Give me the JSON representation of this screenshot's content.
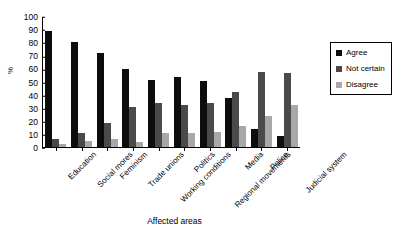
{
  "chart_data": {
    "type": "bar",
    "title": "",
    "subtitle": "",
    "xlabel": "Affected areas",
    "ylabel": "%",
    "ylim": [
      0,
      100
    ],
    "yticks": [
      0,
      10,
      20,
      30,
      40,
      50,
      60,
      70,
      80,
      90,
      100
    ],
    "grid": false,
    "legend_position": "right",
    "categories": [
      "Education",
      "Social mores",
      "Feminism",
      "Trade unions",
      "Working conditions",
      "Politics",
      "Regional movements",
      "Media",
      "Police",
      "Judicial system"
    ],
    "series": [
      {
        "name": "Agree",
        "color": "#0d0d0d",
        "values": [
          89,
          80.5,
          72.5,
          60,
          51.5,
          54,
          50.5,
          37.5,
          14,
          8.5
        ]
      },
      {
        "name": "Not certain",
        "color": "#4a4a4a",
        "values": [
          6,
          11,
          18.5,
          30.5,
          33.5,
          32.5,
          34,
          42,
          58,
          57
        ]
      },
      {
        "name": "Disagree",
        "color": "#a8a8a8",
        "values": [
          2.5,
          5,
          6,
          4,
          10.5,
          11,
          11.5,
          16,
          23.5,
          32.5
        ]
      }
    ]
  },
  "legend": {
    "items": [
      {
        "label": "Agree",
        "color": "#0d0d0d"
      },
      {
        "label": "Not certain",
        "color": "#4a4a4a"
      },
      {
        "label": "Disagree",
        "color": "#a8a8a8"
      }
    ]
  }
}
